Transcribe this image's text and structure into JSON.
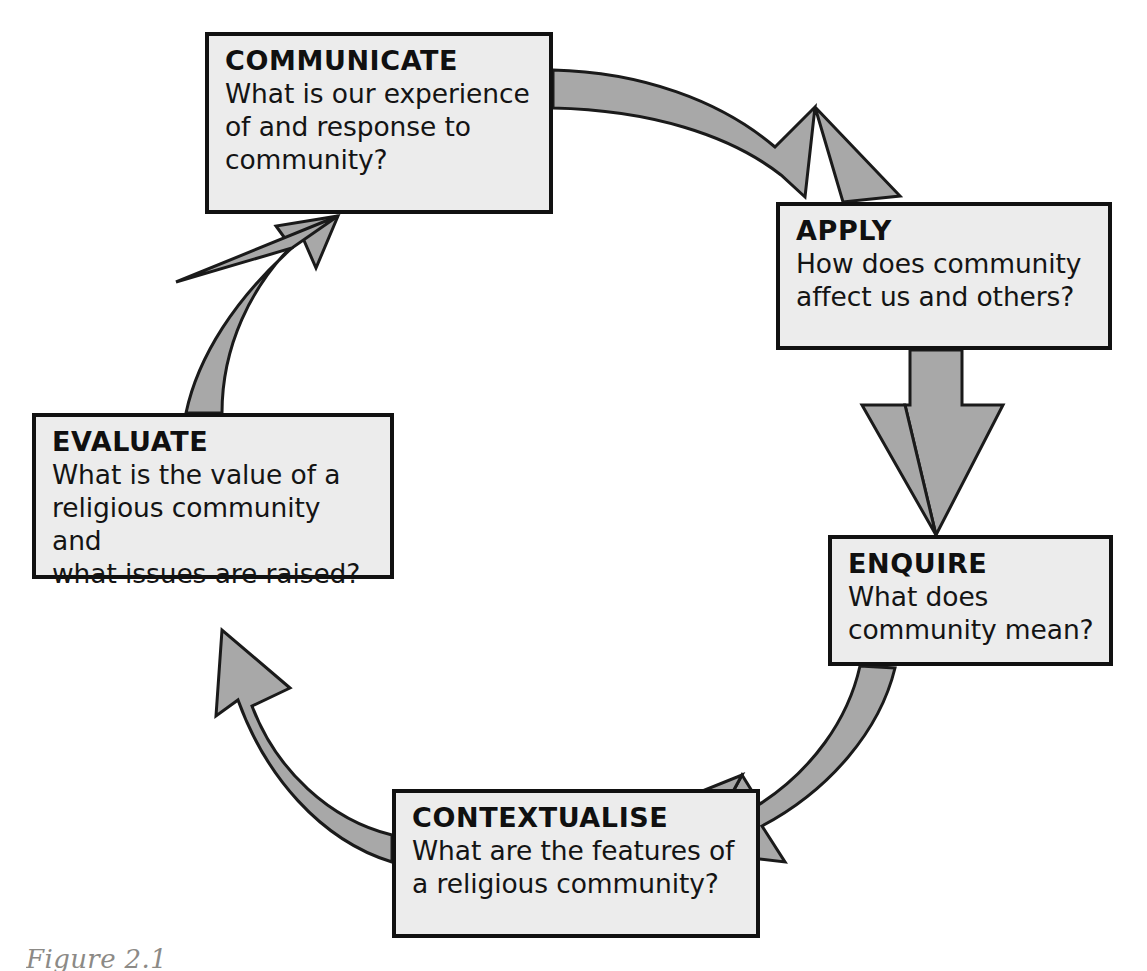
{
  "diagram": {
    "colors": {
      "box_fill": "#ececec",
      "box_border": "#111111",
      "arrow_fill": "#a8a8a8",
      "arrow_stroke": "#1a1a1a",
      "caption_text": "#8c8a86",
      "background": "#ffffff"
    },
    "nodes": [
      {
        "id": "communicate",
        "title": "COMMUNICATE",
        "lines": [
          "What is our experience",
          "of and response to",
          "community?"
        ]
      },
      {
        "id": "apply",
        "title": "APPLY",
        "lines": [
          "How does community",
          "affect us and others?"
        ]
      },
      {
        "id": "enquire",
        "title": "ENQUIRE",
        "lines": [
          "What does",
          "community mean?"
        ]
      },
      {
        "id": "contextualise",
        "title": "CONTEXTUALISE",
        "lines": [
          "What are the features of",
          "a religious community?"
        ]
      },
      {
        "id": "evaluate",
        "title": "EVALUATE",
        "lines": [
          "What is the value of a",
          "religious community and",
          "what issues are raised?"
        ]
      }
    ],
    "arrows": [
      {
        "id": "communicate-to-apply",
        "from": "communicate",
        "to": "apply",
        "shape": "curved-band-arrow",
        "direction": "clockwise"
      },
      {
        "id": "apply-to-enquire",
        "from": "apply",
        "to": "enquire",
        "shape": "straight-band-arrow",
        "direction": "down"
      },
      {
        "id": "enquire-to-contextualise",
        "from": "enquire",
        "to": "contextualise",
        "shape": "curved-band-arrow",
        "direction": "clockwise"
      },
      {
        "id": "contextualise-to-evaluate",
        "from": "contextualise",
        "to": "evaluate",
        "shape": "curved-band-arrow",
        "direction": "clockwise"
      },
      {
        "id": "evaluate-to-communicate",
        "from": "evaluate",
        "to": "communicate",
        "shape": "curved-band-arrow",
        "direction": "clockwise"
      }
    ]
  },
  "caption": {
    "text": "Figure 2.1"
  }
}
